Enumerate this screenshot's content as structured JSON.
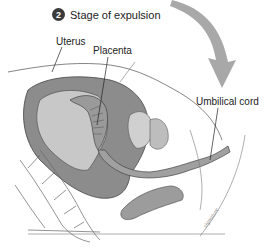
{
  "diagram": {
    "step_number": "2",
    "title": "Stage of expulsion",
    "labels": {
      "uterus": "Uterus",
      "placenta": "Placenta",
      "umbilical_cord": "Umbilical cord"
    },
    "colors": {
      "arrow": "#a8a8a8",
      "tissue_dark": "#8c8c8c",
      "tissue_mid": "#b4b4b4",
      "tissue_light": "#d6d6d6",
      "outline": "#555555"
    }
  }
}
